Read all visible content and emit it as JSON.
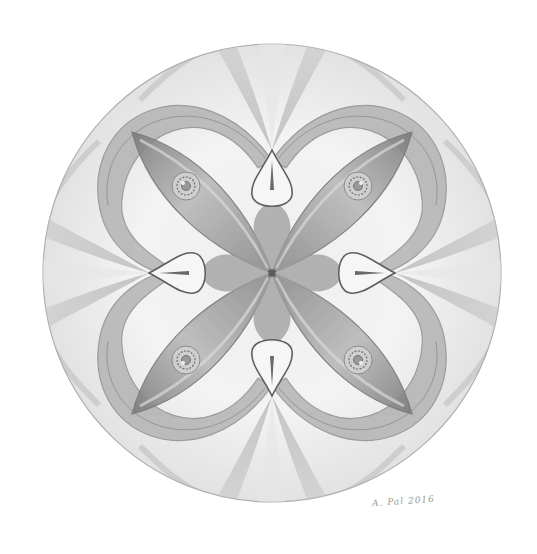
{
  "artwork": {
    "subject": "pencil mandala drawing",
    "description": "Four-fold symmetric graphite mandala within a circle: four lens/eye shaped petals on diagonals with small rosettes, four teardrop loops on the axes, crescent ribbon bands, and fan rays toward the rim",
    "medium": "graphite pencil",
    "palette": {
      "background": "#ffffff",
      "outline": "#8a8a8a",
      "dark_shade": "#6e6e6e",
      "mid_shade": "#a8a8a8",
      "light_shade": "#d4d4d4",
      "paper": "#f4f4f4"
    },
    "circle": {
      "cx": 272,
      "cy": 273,
      "r": 229
    },
    "signature_text": "A. Pal 2016"
  }
}
